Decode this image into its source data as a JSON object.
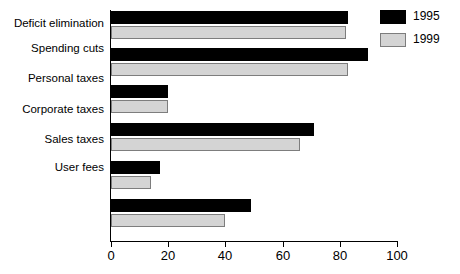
{
  "chart_data": {
    "type": "bar",
    "orientation": "horizontal",
    "title": "",
    "xlabel": "",
    "ylabel": "",
    "xlim": [
      0,
      100
    ],
    "xticks": [
      0,
      20,
      40,
      60,
      80,
      100
    ],
    "grid": false,
    "legend_position": "top-right",
    "categories": [
      "Deficit elimination",
      "Spending cuts",
      "Personal taxes",
      "Corporate taxes",
      "Sales taxes",
      "User fees"
    ],
    "series": [
      {
        "name": "1995",
        "color": "#000000",
        "values": [
          83,
          90,
          20,
          71,
          17,
          49
        ]
      },
      {
        "name": "1999",
        "color": "#d4d4d4",
        "values": [
          82,
          83,
          20,
          66,
          14,
          40
        ]
      }
    ]
  },
  "legend": {
    "entries": [
      {
        "label": "1995",
        "swatch": "black-swatch"
      },
      {
        "label": "1999",
        "swatch": "gray-swatch"
      }
    ]
  },
  "axis": {
    "x_tick_labels": [
      "0",
      "20",
      "40",
      "60",
      "80",
      "100"
    ]
  }
}
